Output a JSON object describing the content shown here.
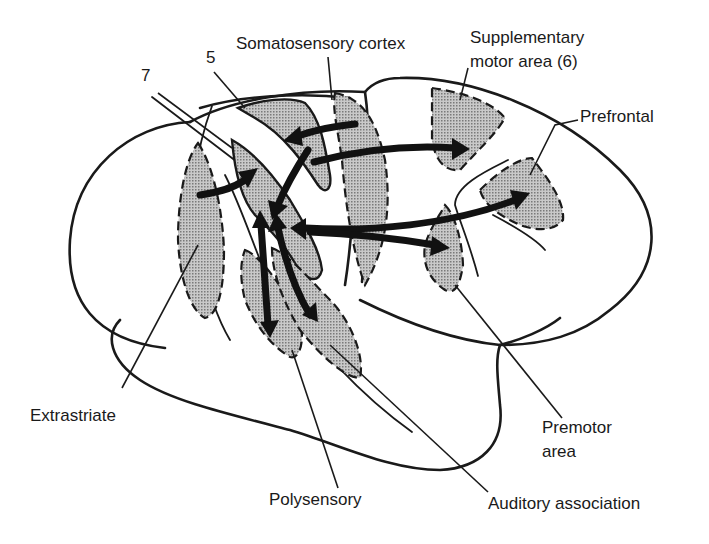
{
  "figure": {
    "colors": {
      "ink": "#1a1a1a",
      "region_fill": "#b8b8b8",
      "background": "#ffffff"
    },
    "labels": {
      "area_7": "7",
      "area_5": "5",
      "somatosensory": "Somatosensory cortex",
      "supplementary_line1": "Supplementary",
      "supplementary_line2": "motor area (6)",
      "prefrontal": "Prefrontal",
      "extrastriate": "Extrastriate",
      "premotor_line1": "Premotor",
      "premotor_line2": "area",
      "polysensory": "Polysensory",
      "auditory": "Auditory association"
    },
    "connections": [
      {
        "from": "Extrastriate",
        "to": "Area 7",
        "direction": "one-way"
      },
      {
        "from": "Somatosensory cortex",
        "to": "Area 5",
        "direction": "one-way"
      },
      {
        "from": "Area 5",
        "to": "Supplementary motor area (6)",
        "direction": "one-way"
      },
      {
        "from": "Area 5",
        "to": "Area 7",
        "direction": "one-way"
      },
      {
        "from": "Area 7",
        "to": "Prefrontal",
        "direction": "two-way"
      },
      {
        "from": "Area 7",
        "to": "Premotor area",
        "direction": "one-way"
      },
      {
        "from": "Area 7",
        "to": "Polysensory",
        "direction": "two-way"
      },
      {
        "from": "Area 7",
        "to": "Auditory association",
        "direction": "two-way"
      }
    ]
  }
}
